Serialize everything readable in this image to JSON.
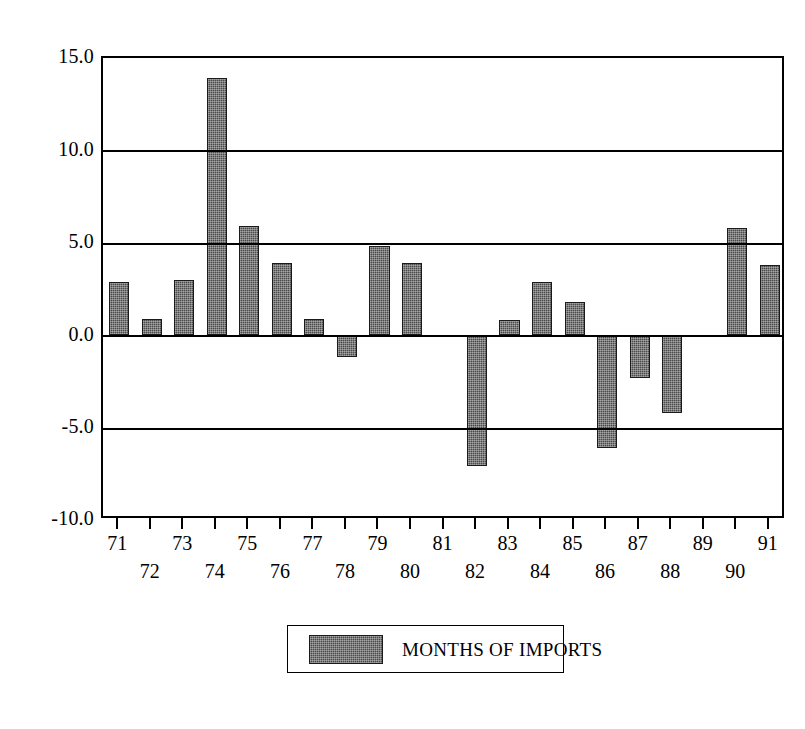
{
  "chart_data": {
    "type": "bar",
    "title": "",
    "subtitle": "",
    "xlabel": "",
    "ylabel": "",
    "categories": [
      "71",
      "72",
      "73",
      "74",
      "75",
      "76",
      "77",
      "78",
      "79",
      "80",
      "81",
      "82",
      "83",
      "84",
      "85",
      "86",
      "87",
      "88",
      "89",
      "90",
      "91"
    ],
    "values": [
      2.9,
      0.9,
      3.0,
      13.9,
      5.9,
      3.9,
      0.9,
      -1.2,
      4.8,
      3.9,
      0.0,
      -7.1,
      0.8,
      2.9,
      1.8,
      -6.1,
      -2.3,
      -4.2,
      0.0,
      5.8,
      3.8
    ],
    "series": [
      {
        "name": "MONTHS OF IMPORTS",
        "values": [
          2.9,
          0.9,
          3.0,
          13.9,
          5.9,
          3.9,
          0.9,
          -1.2,
          4.8,
          3.9,
          0.0,
          -7.1,
          0.8,
          2.9,
          1.8,
          -6.1,
          -2.3,
          -4.2,
          0.0,
          5.8,
          3.8
        ]
      }
    ],
    "ylim": [
      -10.0,
      15.0
    ],
    "yticks": [
      15.0,
      10.0,
      5.0,
      0.0,
      -5.0,
      -10.0
    ],
    "ytick_labels": [
      "15.0",
      "10.0",
      "5.0",
      "0.0",
      "-5.0",
      "-10.0"
    ],
    "xtick_labels": [
      "71",
      "72",
      "73",
      "74",
      "75",
      "76",
      "77",
      "78",
      "79",
      "80",
      "81",
      "82",
      "83",
      "84",
      "85",
      "86",
      "87",
      "88",
      "89",
      "90",
      "91"
    ],
    "grid": true,
    "grid_axis": "y",
    "legend": {
      "position": "bottom-center",
      "entries": [
        {
          "label": "MONTHS OF IMPORTS",
          "color": "#4a4a4a",
          "pattern": "dotted-fill"
        }
      ]
    },
    "bar_color": "#4a4a4a",
    "frame_color": "#000000",
    "background_color": "#ffffff"
  }
}
